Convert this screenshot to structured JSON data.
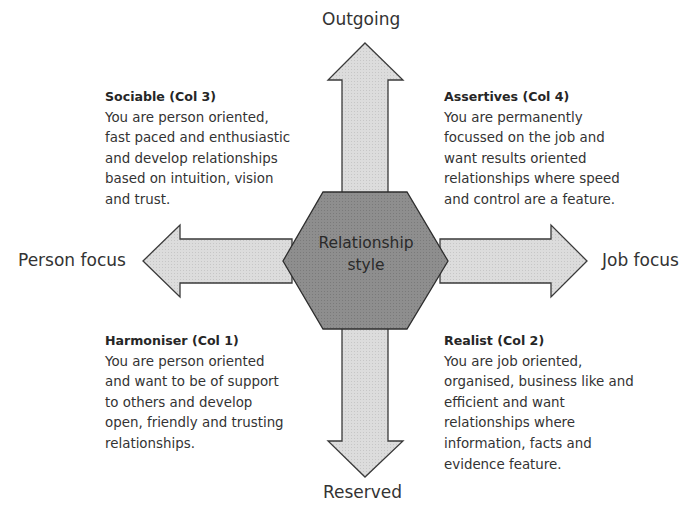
{
  "colors": {
    "arrow_fill": "#d9d9d9",
    "arrow_stroke": "#3a3a3a",
    "hexagon_fill": "#8c8c8c",
    "hexagon_stroke": "#2e2e2e",
    "text": "#333333"
  },
  "diagram": {
    "center_label_line1": "Relationship",
    "center_label_line2": "style",
    "axes": {
      "top": "Outgoing",
      "bottom": "Reserved",
      "left": "Person focus",
      "right": "Job focus"
    },
    "quadrants": {
      "top_left": {
        "title": "Sociable (Col 3)",
        "lines": [
          "You are person oriented,",
          "fast paced and enthusiastic",
          "and develop relationships",
          "based on intuition, vision",
          "and trust."
        ]
      },
      "top_right": {
        "title": "Assertives (Col 4)",
        "lines": [
          "You are permanently",
          "focussed on the job and",
          "want results oriented",
          "relationships where speed",
          "and control are a feature."
        ]
      },
      "bottom_left": {
        "title": "Harmoniser (Col 1)",
        "lines": [
          "You are person oriented",
          "and want to be of support",
          "to others and develop",
          "open, friendly and trusting",
          "relationships."
        ]
      },
      "bottom_right": {
        "title": "Realist (Col 2)",
        "lines": [
          "You are job oriented,",
          "organised, business like and",
          "efficient and want",
          "relationships where",
          "information, facts and",
          "evidence feature."
        ]
      }
    }
  }
}
